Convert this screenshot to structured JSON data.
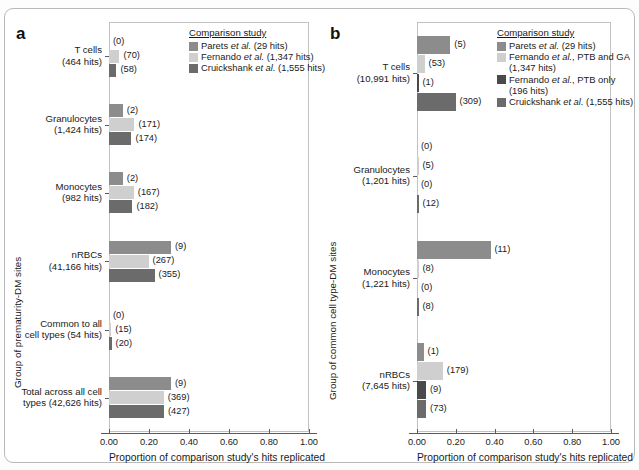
{
  "figure": {
    "panels": [
      {
        "letter": "a",
        "yaxis_title": "Group of prematurity-DM sites",
        "xaxis_title": "Proportion of comparison study's hits replicated",
        "xticks": [
          "0.00",
          "0.20",
          "0.40",
          "0.60",
          "0.80",
          "1.00"
        ],
        "xlim": [
          0.0,
          1.0
        ],
        "legend_title": "Comparison study",
        "legend": [
          {
            "label": "Parets et al. (29 hits)",
            "color": "#8c8c8c"
          },
          {
            "label": "Fernando et al. (1,347 hits)",
            "color": "#cfcfcf"
          },
          {
            "label": "Cruickshank et al. (1,555 hits)",
            "color": "#6b6b6b"
          }
        ],
        "groups": [
          {
            "label": "T cells",
            "sublabel": "(464 hits)",
            "bars": [
              {
                "series": "Parets et al. (29 hits)",
                "value": 0.0,
                "count": "(0)",
                "color": "#8c8c8c"
              },
              {
                "series": "Fernando et al. (1,347 hits)",
                "value": 0.052,
                "count": "(70)",
                "color": "#cfcfcf"
              },
              {
                "series": "Cruickshank et al. (1,555 hits)",
                "value": 0.037,
                "count": "(58)",
                "color": "#6b6b6b"
              }
            ]
          },
          {
            "label": "Granulocytes",
            "sublabel": "(1,424 hits)",
            "bars": [
              {
                "series": "Parets et al. (29 hits)",
                "value": 0.069,
                "count": "(2)",
                "color": "#8c8c8c"
              },
              {
                "series": "Fernando et al. (1,347 hits)",
                "value": 0.127,
                "count": "(171)",
                "color": "#cfcfcf"
              },
              {
                "series": "Cruickshank et al. (1,555 hits)",
                "value": 0.112,
                "count": "(174)",
                "color": "#6b6b6b"
              }
            ]
          },
          {
            "label": "Monocytes",
            "sublabel": "(982 hits)",
            "bars": [
              {
                "series": "Parets et al. (29 hits)",
                "value": 0.069,
                "count": "(2)",
                "color": "#8c8c8c"
              },
              {
                "series": "Fernando et al. (1,347 hits)",
                "value": 0.124,
                "count": "(167)",
                "color": "#cfcfcf"
              },
              {
                "series": "Cruickshank et al. (1,555 hits)",
                "value": 0.117,
                "count": "(182)",
                "color": "#6b6b6b"
              }
            ]
          },
          {
            "label": "nRBCs",
            "sublabel": "(41,166 hits)",
            "bars": [
              {
                "series": "Parets et al. (29 hits)",
                "value": 0.31,
                "count": "(9)",
                "color": "#8c8c8c"
              },
              {
                "series": "Fernando et al. (1,347 hits)",
                "value": 0.198,
                "count": "(267)",
                "color": "#cfcfcf"
              },
              {
                "series": "Cruickshank et al. (1,555 hits)",
                "value": 0.228,
                "count": "(355)",
                "color": "#6b6b6b"
              }
            ]
          },
          {
            "label": "Common to all",
            "sublabel": "cell types (54 hits)",
            "bars": [
              {
                "series": "Parets et al. (29 hits)",
                "value": 0.0,
                "count": "(0)",
                "color": "#8c8c8c"
              },
              {
                "series": "Fernando et al. (1,347 hits)",
                "value": 0.011,
                "count": "(15)",
                "color": "#cfcfcf"
              },
              {
                "series": "Cruickshank et al. (1,555 hits)",
                "value": 0.013,
                "count": "(20)",
                "color": "#6b6b6b"
              }
            ]
          },
          {
            "label": "Total across all cell",
            "sublabel": "types (42,626 hits)",
            "bars": [
              {
                "series": "Parets et al. (29 hits)",
                "value": 0.31,
                "count": "(9)",
                "color": "#8c8c8c"
              },
              {
                "series": "Fernando et al. (1,347 hits)",
                "value": 0.274,
                "count": "(369)",
                "color": "#cfcfcf"
              },
              {
                "series": "Cruickshank et al. (1,555 hits)",
                "value": 0.275,
                "count": "(427)",
                "color": "#6b6b6b"
              }
            ]
          }
        ]
      },
      {
        "letter": "b",
        "yaxis_title": "Group of common cell type-DM sites",
        "xaxis_title": "Proportion of comparison study's hits replicated",
        "xticks": [
          "0.00",
          "0.20",
          "0.40",
          "0.60",
          "0.80",
          "1.00"
        ],
        "xlim": [
          0.0,
          1.0
        ],
        "legend_title": "Comparison study",
        "legend": [
          {
            "label": "Parets et al. (29 hits)",
            "color": "#8c8c8c"
          },
          {
            "label": "Fernando et al., PTB and GA (1,347 hits)",
            "color": "#cfcfcf"
          },
          {
            "label": "Fernando et al., PTB only (196 hits)",
            "color": "#4a4a4a"
          },
          {
            "label": "Cruickshank et al. (1,555 hits)",
            "color": "#6b6b6b"
          }
        ],
        "groups": [
          {
            "label": "T cells",
            "sublabel": "(10,991 hits)",
            "bars": [
              {
                "series": "Parets et al. (29 hits)",
                "value": 0.172,
                "count": "(5)",
                "color": "#8c8c8c"
              },
              {
                "series": "Fernando et al., PTB and GA (1,347 hits)",
                "value": 0.039,
                "count": "(53)",
                "color": "#cfcfcf"
              },
              {
                "series": "Fernando et al., PTB only (196 hits)",
                "value": 0.005,
                "count": "(1)",
                "color": "#4a4a4a"
              },
              {
                "series": "Cruickshank et al. (1,555 hits)",
                "value": 0.199,
                "count": "(309)",
                "color": "#6b6b6b"
              }
            ]
          },
          {
            "label": "Granulocytes",
            "sublabel": "(1,201 hits)",
            "bars": [
              {
                "series": "Parets et al. (29 hits)",
                "value": 0.0,
                "count": "(0)",
                "color": "#8c8c8c"
              },
              {
                "series": "Fernando et al., PTB and GA (1,347 hits)",
                "value": 0.004,
                "count": "(5)",
                "color": "#cfcfcf"
              },
              {
                "series": "Fernando et al., PTB only (196 hits)",
                "value": 0.0,
                "count": "(0)",
                "color": "#4a4a4a"
              },
              {
                "series": "Cruickshank et al. (1,555 hits)",
                "value": 0.008,
                "count": "(12)",
                "color": "#6b6b6b"
              }
            ]
          },
          {
            "label": "Monocytes",
            "sublabel": "(1,221 hits)",
            "bars": [
              {
                "series": "Parets et al. (29 hits)",
                "value": 0.379,
                "count": "(11)",
                "color": "#8c8c8c"
              },
              {
                "series": "Fernando et al., PTB and GA (1,347 hits)",
                "value": 0.006,
                "count": "(8)",
                "color": "#cfcfcf"
              },
              {
                "series": "Fernando et al., PTB only (196 hits)",
                "value": 0.0,
                "count": "(0)",
                "color": "#4a4a4a"
              },
              {
                "series": "Cruickshank et al. (1,555 hits)",
                "value": 0.005,
                "count": "(8)",
                "color": "#6b6b6b"
              }
            ]
          },
          {
            "label": "nRBCs",
            "sublabel": "(7,645 hits)",
            "bars": [
              {
                "series": "Parets et al. (29 hits)",
                "value": 0.034,
                "count": "(1)",
                "color": "#8c8c8c"
              },
              {
                "series": "Fernando et al., PTB and GA (1,347 hits)",
                "value": 0.133,
                "count": "(179)",
                "color": "#cfcfcf"
              },
              {
                "series": "Fernando et al., PTB only (196 hits)",
                "value": 0.046,
                "count": "(9)",
                "color": "#4a4a4a"
              },
              {
                "series": "Cruickshank et al. (1,555 hits)",
                "value": 0.047,
                "count": "(73)",
                "color": "#6b6b6b"
              }
            ]
          }
        ]
      }
    ]
  },
  "chart_data": {
    "type": "bar",
    "title": "",
    "orientation": "horizontal",
    "panels": [
      {
        "panel": "a",
        "xlabel": "Proportion of comparison study's hits replicated",
        "ylabel": "Group of prematurity-DM sites",
        "xlim": [
          0.0,
          1.0
        ],
        "xticks": [
          0.0,
          0.2,
          0.4,
          0.6,
          0.8,
          1.0
        ],
        "grid": false,
        "legend_position": "top-right",
        "legend_title": "Comparison study",
        "categories": [
          "T cells (464 hits)",
          "Granulocytes (1,424 hits)",
          "Monocytes (982 hits)",
          "nRBCs (41,166 hits)",
          "Common to all cell types (54 hits)",
          "Total across all cell types (42,626 hits)"
        ],
        "series": [
          {
            "name": "Parets et al. (29 hits)",
            "color": "#8c8c8c",
            "values": [
              0.0,
              0.069,
              0.069,
              0.31,
              0.0,
              0.31
            ],
            "counts": [
              0,
              2,
              2,
              9,
              0,
              9
            ]
          },
          {
            "name": "Fernando et al. (1,347 hits)",
            "color": "#cfcfcf",
            "values": [
              0.052,
              0.127,
              0.124,
              0.198,
              0.011,
              0.274
            ],
            "counts": [
              70,
              171,
              167,
              267,
              15,
              369
            ]
          },
          {
            "name": "Cruickshank et al. (1,555 hits)",
            "color": "#6b6b6b",
            "values": [
              0.037,
              0.112,
              0.117,
              0.228,
              0.013,
              0.275
            ],
            "counts": [
              58,
              174,
              182,
              355,
              20,
              427
            ]
          }
        ]
      },
      {
        "panel": "b",
        "xlabel": "Proportion of comparison study's hits replicated",
        "ylabel": "Group of common cell type-DM sites",
        "xlim": [
          0.0,
          1.0
        ],
        "xticks": [
          0.0,
          0.2,
          0.4,
          0.6,
          0.8,
          1.0
        ],
        "grid": false,
        "legend_position": "top-right",
        "legend_title": "Comparison study",
        "categories": [
          "T cells (10,991 hits)",
          "Granulocytes (1,201 hits)",
          "Monocytes (1,221 hits)",
          "nRBCs (7,645 hits)"
        ],
        "series": [
          {
            "name": "Parets et al. (29 hits)",
            "color": "#8c8c8c",
            "values": [
              0.172,
              0.0,
              0.379,
              0.034
            ],
            "counts": [
              5,
              0,
              11,
              1
            ]
          },
          {
            "name": "Fernando et al., PTB and GA (1,347 hits)",
            "color": "#cfcfcf",
            "values": [
              0.039,
              0.004,
              0.006,
              0.133
            ],
            "counts": [
              53,
              5,
              8,
              179
            ]
          },
          {
            "name": "Fernando et al., PTB only (196 hits)",
            "color": "#4a4a4a",
            "values": [
              0.005,
              0.0,
              0.0,
              0.046
            ],
            "counts": [
              1,
              0,
              0,
              9
            ]
          },
          {
            "name": "Cruickshank et al. (1,555 hits)",
            "color": "#6b6b6b",
            "values": [
              0.199,
              0.008,
              0.005,
              0.047
            ],
            "counts": [
              309,
              12,
              8,
              73
            ]
          }
        ]
      }
    ]
  }
}
